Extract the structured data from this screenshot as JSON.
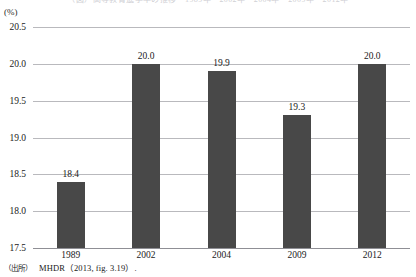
{
  "figure": {
    "title": "（図）高等教育進学率の推移　1989年・2002年・2004年・2009年・2012年",
    "unit_label": "(%)",
    "source_label": "（出所）",
    "source_text": "MHDR（2013, fig. 3.19）."
  },
  "chart_data": {
    "type": "bar",
    "title": "",
    "xlabel": "",
    "ylabel": "(%)",
    "categories": [
      "1989",
      "2002",
      "2004",
      "2009",
      "2012"
    ],
    "values": [
      18.4,
      20.0,
      19.9,
      19.3,
      20.0
    ],
    "value_labels": [
      "18.4",
      "20.0",
      "19.9",
      "19.3",
      "20.0"
    ],
    "ylim": [
      17.5,
      20.5
    ],
    "yticks": [
      20.5,
      20.0,
      19.5,
      19.0,
      18.5,
      18.0,
      17.5
    ],
    "ytick_labels": [
      "20.5",
      "20.0",
      "19.5",
      "19.0",
      "18.5",
      "18.0",
      "17.5"
    ],
    "grid": true,
    "legend": false,
    "bar_color": "#484848",
    "grid_color": "#b9b9bd"
  }
}
